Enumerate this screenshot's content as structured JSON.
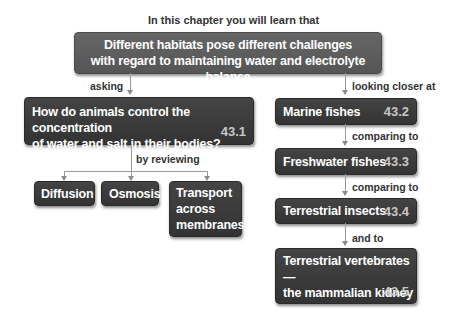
{
  "header": {
    "intro": "In this chapter you will learn that"
  },
  "main_box": {
    "line1": "Different habitats pose different challenges",
    "line2": "with regard to maintaining water and electrolyte balance"
  },
  "left": {
    "connector": "asking",
    "question": {
      "line1": "How do animals control the concentration",
      "line2": "of water and salt in their bodies?",
      "section": "43.1"
    },
    "connector2": "by reviewing",
    "topics": [
      {
        "label": "Diffusion"
      },
      {
        "label": "Osmosis"
      },
      {
        "line1": "Transport",
        "line2": "across",
        "line3": "membranes"
      }
    ]
  },
  "right": {
    "connector": "looking closer at",
    "items": [
      {
        "label": "Marine fishes",
        "section": "43.2"
      },
      {
        "connector": "comparing to",
        "label": "Freshwater fishes",
        "section": "43.3"
      },
      {
        "connector": "comparing to",
        "label": "Terrestrial insects",
        "section": "43.4"
      },
      {
        "connector": "and to",
        "line1": "Terrestrial vertebrates—",
        "line2": "the mammalian kidney",
        "section": "43.5"
      }
    ]
  }
}
